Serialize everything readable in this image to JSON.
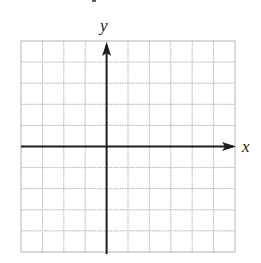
{
  "figure": {
    "type": "coordinate-grid",
    "labels": {
      "x_axis": "x",
      "y_axis": "y"
    },
    "grid": {
      "columns": 10,
      "rows": 10,
      "left": 21,
      "top": 41,
      "right": 235,
      "bottom": 252,
      "line_color": "#b4b4b4",
      "style": "light dotted"
    },
    "axes": {
      "color": "#1e1e1e",
      "y_axis_column_index": 4,
      "x_axis_row_index": 5,
      "x_arrow": "right",
      "y_arrow": "up"
    }
  },
  "chart_data": {
    "type": "scatter",
    "title": "",
    "xlabel": "x",
    "ylabel": "y",
    "x": [],
    "y": [],
    "grid": true,
    "grid_cells": {
      "columns": 10,
      "rows": 10
    },
    "origin_position": {
      "cells_left_of_y_axis": 4,
      "cells_right_of_y_axis": 6,
      "cells_above_x_axis": 5,
      "cells_below_x_axis": 5
    },
    "tick_labels": "none",
    "legend": "none"
  }
}
